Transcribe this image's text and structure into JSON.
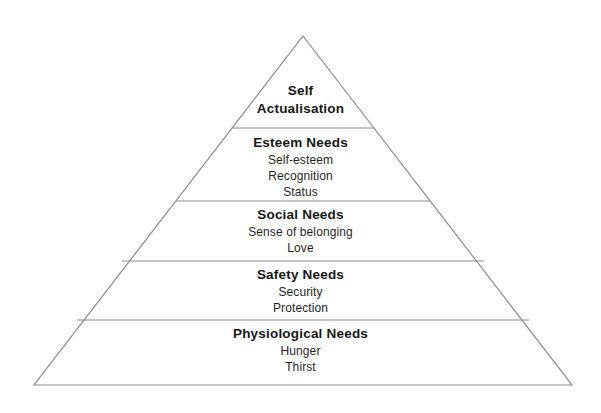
{
  "diagram": {
    "type": "pyramid",
    "name": "Maslow's Hierarchy of Needs",
    "background_color": "#ffffff",
    "line_color": "#8a8a8a",
    "text_color": "#1a1a1a",
    "geometry": {
      "apex": [
        303,
        36
      ],
      "base_left": [
        34,
        385
      ],
      "base_right": [
        572,
        385
      ],
      "divider_y": [
        128,
        201,
        261,
        320
      ]
    },
    "tiers": [
      {
        "id": "self-actualisation",
        "title_lines": [
          "Self",
          "Actualisation"
        ],
        "title": "Self Actualisation",
        "items": []
      },
      {
        "id": "esteem",
        "title": "Esteem Needs",
        "items": [
          "Self-esteem",
          "Recognition",
          "Status"
        ]
      },
      {
        "id": "social",
        "title": "Social Needs",
        "items": [
          "Sense of belonging",
          "Love"
        ]
      },
      {
        "id": "safety",
        "title": "Safety Needs",
        "items": [
          "Security",
          "Protection"
        ]
      },
      {
        "id": "physiological",
        "title": "Physiological Needs",
        "items": [
          "Hunger",
          "Thirst"
        ]
      }
    ]
  }
}
